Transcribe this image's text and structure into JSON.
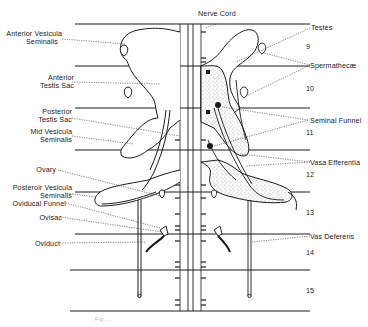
{
  "figure": {
    "type": "anatomical diagram",
    "caption": "Fig. ..."
  },
  "labels": {
    "top": {
      "nerve_cord": "Nerve Cord"
    },
    "left": [
      {
        "id": "anterior-vesicula-seminalis",
        "line1": "Anterior Vesicula",
        "line2": "Seminalis"
      },
      {
        "id": "anterior-testis-sac",
        "line1": "Anterior",
        "line2": "Testis Sac"
      },
      {
        "id": "posterior-testis-sac",
        "line1": "Posterior",
        "line2": "Testis Sac"
      },
      {
        "id": "mid-vesicula-seminalis",
        "line1": "Mid Vesicula",
        "line2": "Seminalis"
      },
      {
        "id": "ovary",
        "line1": "Ovary",
        "line2": ""
      },
      {
        "id": "posterior-vesicula-seminalis",
        "line1": "Posteroir Vesicula",
        "line2": "Seminalis"
      },
      {
        "id": "oviducal-funnel",
        "line1": "Oviducal Funnel",
        "line2": ""
      },
      {
        "id": "ovisac",
        "line1": "Ovisac",
        "line2": ""
      },
      {
        "id": "oviduct",
        "line1": "Oviduct",
        "line2": ""
      }
    ],
    "right": [
      {
        "id": "testes",
        "text": "Testes"
      },
      {
        "id": "spermathecae",
        "text": "Spermathecæ"
      },
      {
        "id": "seminal-funnel",
        "text": "Seminal Funnel"
      },
      {
        "id": "vasa-efferentia",
        "text": "Vasa Efferentia"
      },
      {
        "id": "vas-deferens",
        "text": "Vas Deferens"
      }
    ]
  },
  "segments": [
    "9",
    "10",
    "11",
    "12",
    "13",
    "14",
    "15"
  ],
  "colors": {
    "ink": "#1a1a1a",
    "stipple": "#555555",
    "background": "#ffffff"
  }
}
